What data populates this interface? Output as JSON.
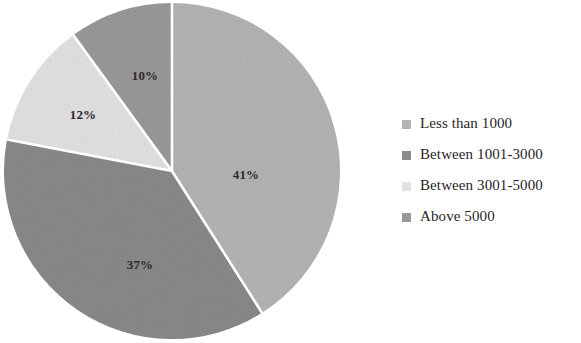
{
  "chart_data": {
    "type": "pie",
    "title": "",
    "subtitle": "",
    "xlabel": "",
    "ylabel": "",
    "legend_position": "right",
    "grid": false,
    "start_angle_deg": 0,
    "direction": "clockwise",
    "categories": [
      "Less than 1000",
      "Between 1001-3000",
      "Between 3001-5000",
      "Above 5000"
    ],
    "values": [
      41,
      37,
      12,
      10
    ],
    "value_unit": "%",
    "data_labels": [
      "41%",
      "37%",
      "12%",
      "10%"
    ],
    "colors": [
      "#b4b4b4",
      "#8a8a8a",
      "#e2e2e2",
      "#9a9a9a"
    ],
    "slice_separator_color": "#ffffff",
    "label_color": "#2b2b2b",
    "slices": [
      {
        "label": "Less than 1000",
        "value": 41,
        "data_label": "41%",
        "color": "#b4b4b4",
        "label_x": 243,
        "label_y": 177
      },
      {
        "label": "Between 1001-3000",
        "value": 37,
        "data_label": "37%",
        "color": "#8a8a8a",
        "label_x": 137,
        "label_y": 267
      },
      {
        "label": "Between 3001-5000",
        "value": 12,
        "data_label": "12%",
        "color": "#e2e2e2",
        "label_x": 80,
        "label_y": 117
      },
      {
        "label": "Above 5000",
        "value": 10,
        "data_label": "10%",
        "color": "#9a9a9a",
        "label_x": 142,
        "label_y": 78
      }
    ]
  },
  "legend": {
    "items": [
      {
        "label": "Less than 1000",
        "color": "#b4b4b4"
      },
      {
        "label": "Between 1001-3000",
        "color": "#8a8a8a"
      },
      {
        "label": "Between 3001-5000",
        "color": "#e2e2e2"
      },
      {
        "label": "Above 5000",
        "color": "#9a9a9a"
      }
    ]
  },
  "figure": {
    "background": "#ffffff"
  }
}
